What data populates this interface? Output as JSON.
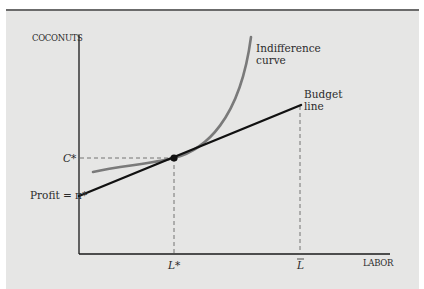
{
  "diagram": {
    "type": "consumer-producer optimum (Robinson Crusoe economy)",
    "axes": {
      "y_label": "COCONUTS",
      "x_label": "LABOR"
    },
    "curves": {
      "indifference_label_line1": "Indifference",
      "indifference_label_line2": "curve",
      "budget_label_line1": "Budget",
      "budget_label_line2": "line"
    },
    "markers": {
      "c_star": "C*",
      "l_star": "L*",
      "l_bar": "L",
      "profit_label": "Profit = π*"
    },
    "colors": {
      "background": "#e6e6e5",
      "border": "#6b6b6b",
      "axis": "#1a1a1a",
      "budget_line": "#111111",
      "indifference_curve": "#7a7a7a",
      "dashed": "#555555",
      "text": "#2b2b2b"
    }
  }
}
